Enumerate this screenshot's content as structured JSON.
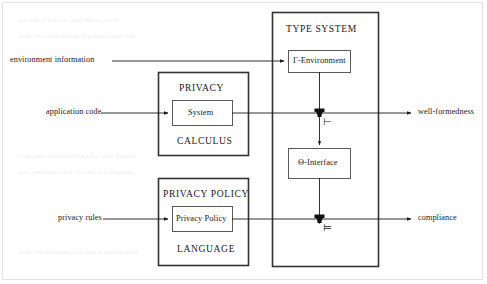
{
  "figure": {
    "type": "block-diagram"
  },
  "groups": {
    "type_system": {
      "title": "TYPE SYSTEM",
      "boxes": {
        "gamma_environment": "Γ-Environment",
        "theta_interface": "Θ-Interface"
      }
    },
    "privacy_calculus": {
      "title_top": "PRIVACY",
      "title_bottom": "CALCULUS",
      "inner_box": "System"
    },
    "privacy_policy_language": {
      "title_top": "PRIVACY POLICY",
      "title_bottom": "LANGUAGE",
      "inner_box": "Privacy Policy"
    }
  },
  "inputs": [
    {
      "label": "environment information"
    },
    {
      "label": "application code"
    },
    {
      "label": "privacy rules"
    }
  ],
  "outputs": [
    {
      "label": "well-formedness"
    },
    {
      "label": "compliance"
    }
  ],
  "judgements": [
    {
      "symbol": "⊢",
      "name": "turnstile"
    },
    {
      "symbol": "⊨",
      "name": "double-turnstile"
    }
  ],
  "colors": {
    "stroke": "#1a1a1a",
    "box_stroke": "#555555",
    "background": "#fefefe",
    "frame": "#e3e3e3"
  }
}
